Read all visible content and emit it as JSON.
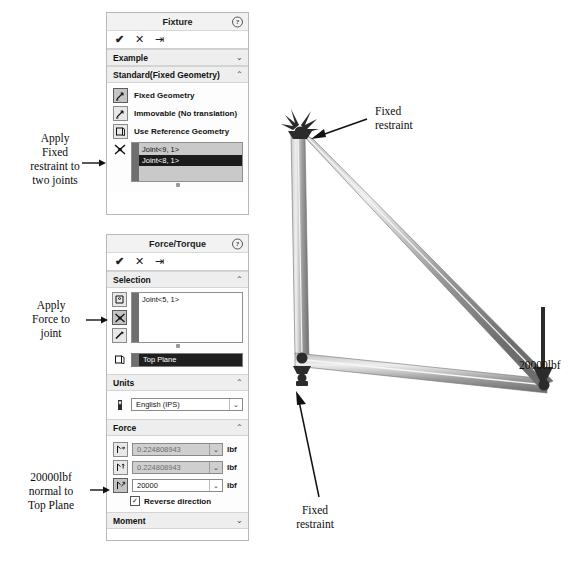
{
  "fixture_panel": {
    "title": "Fixture",
    "help_icon": "help-icon",
    "toolbar": {
      "ok": "✔",
      "cancel": "✕",
      "pin": "⇥"
    },
    "example_section": {
      "label": "Example",
      "chevron": "⌄"
    },
    "standard_section": {
      "label": "Standard(Fixed Geometry)",
      "chevron": "⌃"
    },
    "options": [
      {
        "label": "Fixed Geometry",
        "icon": "fixed-geometry-icon",
        "selected": true
      },
      {
        "label": "Immovable (No translation)",
        "icon": "immovable-icon",
        "selected": false
      },
      {
        "label": "Use Reference Geometry",
        "icon": "reference-geometry-icon",
        "selected": false
      }
    ],
    "selection_icon": "vertex-joint-icon",
    "selected_entities": [
      {
        "name": "Joint<9, 1>",
        "highlighted": false
      },
      {
        "name": "Joint<8, 1>",
        "highlighted": true
      }
    ]
  },
  "force_panel": {
    "title": "Force/Torque",
    "help_icon": "help-icon",
    "toolbar": {
      "ok": "✔",
      "cancel": "✕",
      "pin": "⇥"
    },
    "selection_section": {
      "label": "Selection",
      "chevron": "⌃"
    },
    "selection_icons": [
      {
        "icon": "face-select-icon",
        "selected": false
      },
      {
        "icon": "joint-select-icon",
        "selected": true
      },
      {
        "icon": "beam-select-icon",
        "selected": false
      }
    ],
    "selected_entities": [
      {
        "name": "Joint<5, 1>",
        "highlighted": false
      }
    ],
    "reference_icon": "reference-plane-icon",
    "reference_plane": "Top Plane",
    "units_section": {
      "label": "Units",
      "chevron": "⌃"
    },
    "units_icon": "units-icon",
    "units_value": "English (IPS)",
    "force_section": {
      "label": "Force",
      "chevron": "⌃"
    },
    "force_rows": [
      {
        "icon": "force-x-icon",
        "value": "0.224808943",
        "unit": "lbf",
        "enabled": false,
        "active": false
      },
      {
        "icon": "force-y-icon",
        "value": "0.224808943",
        "unit": "lbf",
        "enabled": false,
        "active": false
      },
      {
        "icon": "force-z-icon",
        "value": "20000",
        "unit": "lbf",
        "enabled": true,
        "active": true
      }
    ],
    "reverse_direction": {
      "label": "Reverse direction",
      "checked": true,
      "mark": "✓"
    },
    "moment_section": {
      "label": "Moment",
      "chevron": "⌄"
    }
  },
  "annotations": {
    "apply_fixed": "Apply\nFixed\nrestraint to\ntwo joints",
    "apply_fixed_lines": [
      "Apply",
      "Fixed",
      "restraint to",
      "two joints"
    ],
    "apply_force_lines": [
      "Apply",
      "Force to",
      "joint"
    ],
    "force_normal_lines": [
      "20000lbf",
      "normal to",
      "Top Plane"
    ],
    "top_restraint_lines": [
      "Fixed",
      "restraint"
    ],
    "bottom_restraint_lines": [
      "Fixed",
      "restraint"
    ],
    "load_label": "20000lbf"
  },
  "colors": {
    "panel_border": "#b9b9b9",
    "section_header_bg": "#eeeeee",
    "listbox_bg": "#c9c9c9",
    "highlight_bg": "#1b1b1b",
    "dim_field_bg": "#cfcfcf",
    "beam_light": "#d5d5d5",
    "beam_dark": "#8e8e8e",
    "restraint_dark": "#2b2b2b"
  }
}
